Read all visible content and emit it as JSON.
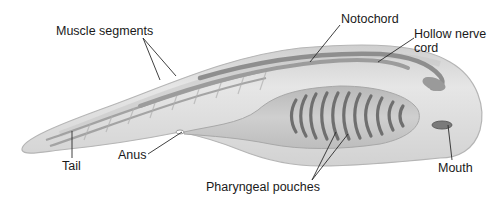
{
  "diagram": {
    "labels": {
      "muscle_segments": "Muscle segments",
      "notochord": "Notochord",
      "hollow_nerve_cord_line1": "Hollow nerve",
      "hollow_nerve_cord_line2": "cord",
      "tail": "Tail",
      "anus": "Anus",
      "pharyngeal_pouches": "Pharyngeal pouches",
      "mouth": "Mouth"
    },
    "pharyngeal_slit_count": 11,
    "colors": {
      "body_fill": "#d9d9d9",
      "body_edge": "#b5b5b5",
      "structure_dark": "#8a8a8a",
      "slit": "#6f6f6f",
      "leader_line": "#2a2a2a",
      "text": "#1a1a1a"
    }
  }
}
